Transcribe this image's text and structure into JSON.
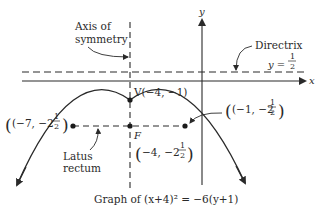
{
  "diagram": {
    "caption": "Graph of (x+4)² = −6(y+1)",
    "axes": {
      "x_label": "x",
      "y_label": "y"
    },
    "axis_of_symmetry": {
      "label_line1": "Axis of",
      "label_line2": "symmetry",
      "equation": "x = −4"
    },
    "directrix": {
      "label": "Directrix",
      "eq_lhs": "y =",
      "eq_num": "1",
      "eq_den": "2"
    },
    "vertex": {
      "label": "V(−4, −1)"
    },
    "focus": {
      "label": "F",
      "coord_prefix": "(−4, −2",
      "frac_num": "1",
      "frac_den": "2",
      "coord_suffix": ")"
    },
    "latus_rectum": {
      "label_line1": "Latus",
      "label_line2": "rectum",
      "left_endpoint": {
        "prefix": "(−7, −2",
        "frac_num": "1",
        "frac_den": "2",
        "suffix": ")"
      },
      "right_endpoint": {
        "prefix": "(−1, −2",
        "frac_num": "1",
        "frac_den": "2",
        "suffix": ")"
      }
    },
    "colors": {
      "ink": "#2a2a2a",
      "background": "#ffffff"
    }
  }
}
